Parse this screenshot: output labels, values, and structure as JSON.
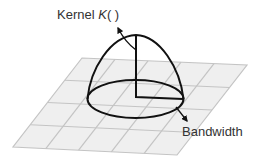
{
  "labels": {
    "kernel_prefix": "Kernel ",
    "kernel_symbol": "K",
    "kernel_suffix": "( )",
    "bandwidth": "Bandwidth"
  },
  "grid": {
    "columns": 5,
    "rows": 4,
    "fill": "#efefef",
    "line": "#c4c4c4"
  },
  "colors": {
    "stroke": "#111111",
    "text": "#333333"
  }
}
